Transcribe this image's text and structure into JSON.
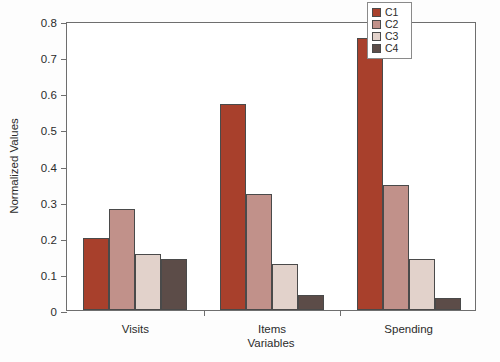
{
  "chart_data": {
    "type": "bar",
    "title": "",
    "xlabel": "Variables",
    "ylabel": "Normalized Values",
    "categories": [
      "Visits",
      "Items",
      "Spending"
    ],
    "series": [
      {
        "name": "C1",
        "color": "#A8402C",
        "values": [
          0.2,
          0.57,
          0.752
        ]
      },
      {
        "name": "C2",
        "color": "#C1918A",
        "values": [
          0.281,
          0.322,
          0.345
        ]
      },
      {
        "name": "C3",
        "color": "#E2D2CB",
        "values": [
          0.155,
          0.128,
          0.142
        ]
      },
      {
        "name": "C4",
        "color": "#5C4C48",
        "values": [
          0.142,
          0.042,
          0.033
        ]
      }
    ],
    "ylim": [
      0,
      0.8
    ],
    "ytick_values": [
      0,
      0.1,
      0.2,
      0.3,
      0.4,
      0.5,
      0.6,
      0.7,
      0.8
    ],
    "ytick_labels": [
      "0",
      "0.1",
      "0.2",
      "0.3",
      "0.4",
      "0.5",
      "0.6",
      "0.7",
      "0.8"
    ],
    "grid": false,
    "legend_position": "top-right",
    "legend_entries": [
      "C1",
      "C2",
      "C3",
      "C4"
    ]
  }
}
